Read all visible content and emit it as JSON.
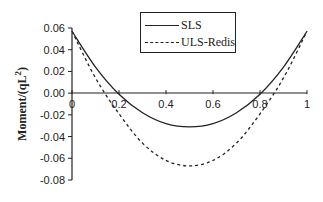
{
  "chart_data": {
    "type": "line",
    "title": "",
    "xlabel": "",
    "ylabel": "Moment/(qL²)",
    "xlim": [
      0,
      1
    ],
    "ylim": [
      -0.08,
      0.06
    ],
    "grid": false,
    "legend_position": "top-center",
    "x_ticks": [
      "0",
      "0.2",
      "0.4",
      "0.6",
      "0.8",
      "1"
    ],
    "y_ticks": [
      "0.06",
      "0.04",
      "0.02",
      "0.00",
      "-0.02",
      "-0.04",
      "-0.06",
      "-0.08"
    ],
    "x": [
      0,
      0.1,
      0.2,
      0.3,
      0.4,
      0.5,
      0.6,
      0.7,
      0.8,
      0.9,
      1.0
    ],
    "series": [
      {
        "name": "SLS",
        "style": "solid",
        "values": [
          0.057,
          0.024,
          -0.001,
          -0.018,
          -0.028,
          -0.031,
          -0.028,
          -0.018,
          -0.001,
          0.024,
          0.057
        ]
      },
      {
        "name": "ULS-Redis",
        "style": "dashed",
        "values": [
          0.057,
          0.014,
          -0.019,
          -0.046,
          -0.062,
          -0.067,
          -0.062,
          -0.046,
          -0.019,
          0.014,
          0.057
        ]
      }
    ]
  },
  "legend": {
    "items": [
      "SLS",
      "ULS-Redis"
    ]
  },
  "axes": {
    "ylabel_main": "Moment/(qL",
    "ylabel_sup": "2",
    "ylabel_end": ")"
  }
}
